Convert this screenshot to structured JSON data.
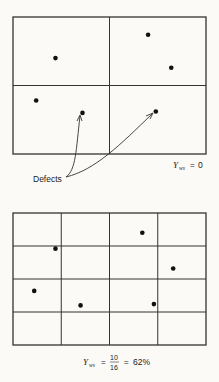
{
  "panels": [
    {
      "id": "large-die",
      "grid_cols": 2,
      "grid_rows": 2,
      "defects": [
        [
          0.22,
          0.3
        ],
        [
          0.7,
          0.13
        ],
        [
          0.82,
          0.37
        ],
        [
          0.12,
          0.61
        ],
        [
          0.36,
          0.7
        ],
        [
          0.74,
          0.69
        ]
      ],
      "yield_label": {
        "symbol": "Y",
        "subscript": "ws",
        "equals": "=",
        "value": "0"
      }
    },
    {
      "id": "small-die",
      "grid_cols": 4,
      "grid_rows": 4,
      "defects": [
        [
          0.22,
          0.27
        ],
        [
          0.67,
          0.15
        ],
        [
          0.83,
          0.42
        ],
        [
          0.11,
          0.59
        ],
        [
          0.35,
          0.7
        ],
        [
          0.73,
          0.69
        ]
      ],
      "yield_label": {
        "symbol": "Y",
        "subscript": "ws",
        "equals": "=",
        "numerator": "10",
        "denominator": "16",
        "equals2": "=",
        "value": "62%"
      }
    }
  ],
  "annotation": {
    "label": "Defects",
    "points_to": [
      4,
      5
    ]
  },
  "colors": {
    "line": "#333333",
    "dot": "#111111",
    "background": "#fbfaf6"
  }
}
